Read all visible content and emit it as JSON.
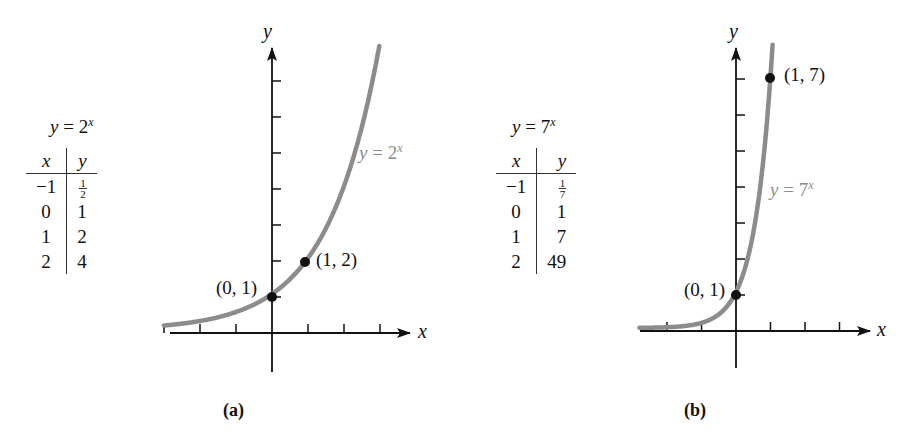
{
  "figure": {
    "panels": [
      {
        "caption": "(a)",
        "table_title_base": "y = 2",
        "table_title_exp": "x",
        "table_headers": [
          "x",
          "y"
        ],
        "table_rows": [
          [
            "−1",
            "1/2"
          ],
          [
            "0",
            "1"
          ],
          [
            "1",
            "2"
          ],
          [
            "2",
            "4"
          ]
        ],
        "curve_label_base": "y = 2",
        "curve_label_exp": "x",
        "points": [
          {
            "label": "(0, 1)"
          },
          {
            "label": "(1, 2)"
          }
        ],
        "axis_x_label": "x",
        "axis_y_label": "y"
      },
      {
        "caption": "(b)",
        "table_title_base": "y = 7",
        "table_title_exp": "x",
        "table_headers": [
          "x",
          "y"
        ],
        "table_rows": [
          [
            "−1",
            "1/7"
          ],
          [
            "0",
            "1"
          ],
          [
            "1",
            "7"
          ],
          [
            "2",
            "49"
          ]
        ],
        "curve_label_base": "y = 7",
        "curve_label_exp": "x",
        "points": [
          {
            "label": "(0, 1)"
          },
          {
            "label": "(1, 7)"
          }
        ],
        "axis_x_label": "x",
        "axis_y_label": "y"
      }
    ],
    "curve_color": "#8c8c8c",
    "axis_color": "#111111"
  },
  "chart_data": [
    {
      "type": "line",
      "title": "y = 2^x",
      "caption": "(a)",
      "xlabel": "x",
      "ylabel": "y",
      "series": [
        {
          "name": "y = 2^x",
          "function": "2^x",
          "x": [
            -3,
            -2,
            -1,
            0,
            1,
            2,
            3
          ],
          "values": [
            0.125,
            0.25,
            0.5,
            1,
            2,
            4,
            8
          ]
        }
      ],
      "table": {
        "headers": [
          "x",
          "y"
        ],
        "rows": [
          [
            -1,
            0.5
          ],
          [
            0,
            1
          ],
          [
            1,
            2
          ],
          [
            2,
            4
          ]
        ]
      },
      "highlighted_points": [
        [
          0,
          1
        ],
        [
          1,
          2
        ]
      ],
      "x_ticks": [
        -3,
        -2,
        -1,
        1,
        2,
        3
      ],
      "y_ticks": [
        1,
        2,
        3,
        4,
        5,
        6,
        7
      ],
      "xlim": [
        -3,
        3.8
      ],
      "ylim": [
        -1,
        8
      ],
      "grid": false,
      "tick_labels_shown": false
    },
    {
      "type": "line",
      "title": "y = 7^x",
      "caption": "(b)",
      "xlabel": "x",
      "ylabel": "y",
      "series": [
        {
          "name": "y = 7^x",
          "function": "7^x",
          "x": [
            -3,
            -2,
            -1,
            0,
            1,
            1.1
          ],
          "values": [
            0.0029,
            0.0204,
            0.1429,
            1,
            7,
            8.5
          ]
        }
      ],
      "table": {
        "headers": [
          "x",
          "y"
        ],
        "rows": [
          [
            -1,
            0.142857
          ],
          [
            0,
            1
          ],
          [
            1,
            7
          ],
          [
            2,
            49
          ]
        ]
      },
      "highlighted_points": [
        [
          0,
          1
        ],
        [
          1,
          7
        ]
      ],
      "x_ticks": [
        -2,
        -1,
        1,
        2,
        3
      ],
      "y_ticks": [
        1,
        2,
        3,
        4,
        5,
        6,
        7
      ],
      "xlim": [
        -2.8,
        3.9
      ],
      "ylim": [
        -1,
        8.5
      ],
      "grid": false,
      "tick_labels_shown": false
    }
  ]
}
